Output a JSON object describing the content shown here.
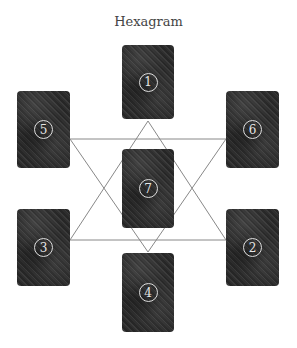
{
  "title": "Hexagram",
  "colors": {
    "card": "#2f2f2f",
    "line": "#888888",
    "title": "#444444"
  },
  "cards": [
    {
      "id": "1",
      "label": "1",
      "position": "top-center"
    },
    {
      "id": "2",
      "label": "2",
      "position": "lower-right"
    },
    {
      "id": "3",
      "label": "3",
      "position": "lower-left"
    },
    {
      "id": "4",
      "label": "4",
      "position": "bottom-center"
    },
    {
      "id": "5",
      "label": "5",
      "position": "upper-left"
    },
    {
      "id": "6",
      "label": "6",
      "position": "upper-right"
    },
    {
      "id": "7",
      "label": "7",
      "position": "center"
    }
  ]
}
